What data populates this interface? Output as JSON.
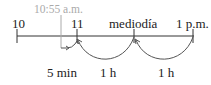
{
  "diagram": {
    "type": "number-line-time",
    "start_time_label": "10:55 a.m.",
    "ticks": [
      {
        "label": "10",
        "x": 17
      },
      {
        "label": "11",
        "x": 77
      },
      {
        "label": "mediodía",
        "x": 134
      },
      {
        "label": "1 p.m.",
        "x": 193
      }
    ],
    "jumps": [
      {
        "label": "5 min",
        "from": "10:55 a.m.",
        "to": "11"
      },
      {
        "label": "1 h",
        "from": "11",
        "to": "mediodía"
      },
      {
        "label": "1 h",
        "from": "mediodía",
        "to": "1 p.m."
      }
    ],
    "colors": {
      "line": "#333333",
      "start_marker": "#aaaaaa"
    }
  }
}
